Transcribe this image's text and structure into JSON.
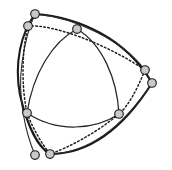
{
  "figure": {
    "canvas": {
      "width": 172,
      "height": 170
    },
    "background_color": "#ffffff",
    "stroke_color": "#1a1a1a",
    "node_fill_color": "#c9c9c9",
    "node_stroke_color": "#1a1a1a",
    "node_radius": 4.3
  },
  "chart_data": {
    "type": "scatter",
    "xlabel": "",
    "ylabel": "",
    "xlim": [
      0,
      172
    ],
    "ylim": [
      0,
      170
    ],
    "grid": false,
    "legend": null,
    "nodes": [
      {
        "id": "n1",
        "label": "top-apex",
        "x": 35,
        "y": 14
      },
      {
        "id": "n2",
        "label": "upper-left",
        "x": 28,
        "y": 26
      },
      {
        "id": "n3",
        "label": "top-middle",
        "x": 77,
        "y": 29
      },
      {
        "id": "n4",
        "label": "right-upper",
        "x": 145,
        "y": 70
      },
      {
        "id": "n5",
        "label": "right-lower",
        "x": 152,
        "y": 83
      },
      {
        "id": "n6",
        "label": "left-middle",
        "x": 27,
        "y": 113
      },
      {
        "id": "n7",
        "label": "center-right",
        "x": 119,
        "y": 114
      },
      {
        "id": "n8",
        "label": "bottom-left",
        "x": 35,
        "y": 155
      },
      {
        "id": "n9",
        "label": "bottom-middle",
        "x": 50,
        "y": 154
      }
    ],
    "paths": [
      {
        "id": "outer-hull",
        "label": "outer bulging triangular hull",
        "style": "solid",
        "weight": "heavy",
        "d": "M 35 14 C 78 17 126 38 152 83 C 121 132 86 154 50 154 C 41 149 29 133 20 95 C 14 63 21 33 35 14 Z"
      },
      {
        "id": "outer-hull-secondary",
        "label": "secondary outer edge trace",
        "style": "solid",
        "weight": "light",
        "d": "M 35 14 C 76 18 122 40 145 70 M 152 83 C 120 131 85 153 50 154 M 35 155 C 26 134 17 97 22 63 C 25 40 29 27 35 14"
      },
      {
        "id": "inner-arc-top-left",
        "label": "inner arc top to left",
        "style": "solid",
        "weight": "medium",
        "d": "M 77 29 C 52 42 33 74 27 113"
      },
      {
        "id": "inner-arc-top-right",
        "label": "inner arc top to right",
        "style": "solid",
        "weight": "medium",
        "d": "M 77 29 C 102 44 117 78 119 114"
      },
      {
        "id": "inner-arc-bottom",
        "label": "inner arc left to right",
        "style": "solid",
        "weight": "medium",
        "d": "M 27 113 C 57 133 95 130 119 114"
      },
      {
        "id": "dotted-top-edge",
        "label": "dotted chord upper-left to right-upper",
        "style": "dotted",
        "d": "M 28 26 C 52 24 105 43 145 70"
      },
      {
        "id": "dotted-right-edge",
        "label": "dotted chord right-upper to center-right",
        "style": "dotted",
        "d": "M 145 70 C 136 92 128 106 119 114"
      },
      {
        "id": "dotted-bottom-edge",
        "label": "dotted chord center-right to bottom-middle",
        "style": "dotted",
        "d": "M 119 114 C 96 133 70 147 50 154"
      },
      {
        "id": "dotted-left-edge",
        "label": "dotted chord left-middle to bottom-middle",
        "style": "dotted",
        "d": "M 27 113 C 33 129 42 144 50 154"
      },
      {
        "id": "dotted-upper-left-edge",
        "label": "dotted chord upper-left to left-middle",
        "style": "dotted",
        "d": "M 28 26 C 21 55 22 90 27 113"
      }
    ]
  }
}
